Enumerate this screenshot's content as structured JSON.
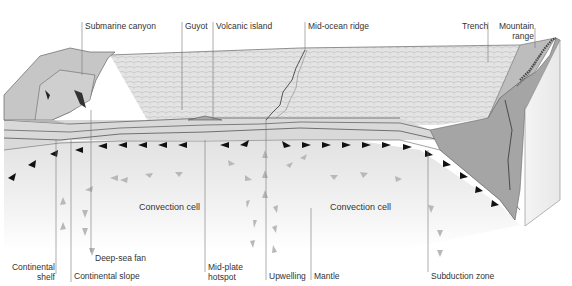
{
  "top_labels": [
    {
      "id": "submarine-canyon",
      "text": "Submarine canyon"
    },
    {
      "id": "guyot",
      "text": "Guyot"
    },
    {
      "id": "volcanic-island",
      "text": "Volcanic island"
    },
    {
      "id": "mid-ocean-ridge",
      "text": "Mid-ocean ridge"
    },
    {
      "id": "trench",
      "text": "Trench"
    },
    {
      "id": "mountain-range-1",
      "text": "Mountain"
    },
    {
      "id": "mountain-range-2",
      "text": "range"
    }
  ],
  "middle_labels": [
    {
      "id": "convection-cell-left",
      "text": "Convection cell"
    },
    {
      "id": "convection-cell-right",
      "text": "Convection cell"
    }
  ],
  "bottom_labels": [
    {
      "id": "continental-shelf-1",
      "text": "Continental"
    },
    {
      "id": "continental-shelf-2",
      "text": "shelf"
    },
    {
      "id": "deep-sea-fan",
      "text": "Deep-sea fan"
    },
    {
      "id": "continental-slope",
      "text": "Continental slope"
    },
    {
      "id": "mid-plate-hotspot-1",
      "text": "Mid-plate"
    },
    {
      "id": "mid-plate-hotspot-2",
      "text": "hotspot"
    },
    {
      "id": "upwelling",
      "text": "Upwelling"
    },
    {
      "id": "mantle",
      "text": "Mantle"
    },
    {
      "id": "subduction-zone",
      "text": "Subduction zone"
    }
  ],
  "colors": {
    "ocean_floor": "#dcdcdc",
    "crust_face": "#bdbdbd",
    "continent": "#c8c8c8",
    "trench_block": "#9e9e9e",
    "mantle": "#efefef",
    "arrow_dark": "#111111",
    "arrow_light": "#b5b5b5",
    "line": "#555555"
  }
}
